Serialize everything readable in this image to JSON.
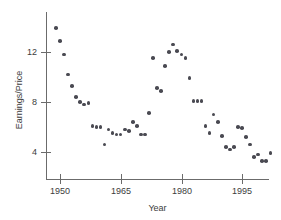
{
  "chart_data": {
    "type": "scatter",
    "title": "",
    "xlabel": "Year",
    "ylabel": "Earnings/Price",
    "xlim": [
      1947.5,
      2003.5
    ],
    "ylim": [
      2.6,
      14.6
    ],
    "xticks": [
      1950,
      1965,
      1980,
      1995
    ],
    "xticklabels": [
      "1950",
      "1965",
      "1980",
      "1995"
    ],
    "yticks": [
      4,
      8,
      12
    ],
    "yticklabels": [
      "4",
      "8",
      "12"
    ],
    "grid": false,
    "legend": null,
    "marker_color": "#4a4a52",
    "axis_color": "#6b6b6b",
    "series": [
      {
        "name": "Earnings/Price",
        "x": [
          1949,
          1950,
          1951,
          1952,
          1953,
          1954,
          1955,
          1956,
          1957,
          1958,
          1959,
          1960,
          1961,
          1962,
          1963,
          1964,
          1965,
          1966,
          1967,
          1968,
          1969,
          1970,
          1971,
          1972,
          1973,
          1974,
          1975,
          1976,
          1977,
          1978,
          1979,
          1980,
          1981,
          1982,
          1983,
          1984,
          1985,
          1986,
          1987,
          1988,
          1989,
          1990,
          1991,
          1992,
          1993,
          1994,
          1995,
          1996,
          1997,
          1998,
          1999,
          2000,
          2001,
          2002
        ],
        "y": [
          13.9,
          12.9,
          11.8,
          10.2,
          9.3,
          8.4,
          8.0,
          7.8,
          7.9,
          6.1,
          6.0,
          6.0,
          4.6,
          5.8,
          5.5,
          5.4,
          5.4,
          5.8,
          5.7,
          6.4,
          6.1,
          5.4,
          5.4,
          7.1,
          11.5,
          9.1,
          8.9,
          10.9,
          12.0,
          12.6,
          12.1,
          11.8,
          11.5,
          9.9,
          8.1,
          8.1,
          8.1,
          6.1,
          5.5,
          7.0,
          6.4,
          5.3,
          4.4,
          4.2,
          4.4,
          6.0,
          5.9,
          5.2,
          4.6,
          3.6,
          3.8,
          3.3,
          3.3,
          3.9
        ],
        "marker": "circle"
      }
    ]
  },
  "axes": {
    "y_title": "Earnings/Price",
    "x_title": "Year",
    "y_tick_labels": [
      "12",
      "8",
      "4"
    ],
    "x_tick_labels": [
      "1950",
      "1965",
      "1980",
      "1995"
    ]
  }
}
